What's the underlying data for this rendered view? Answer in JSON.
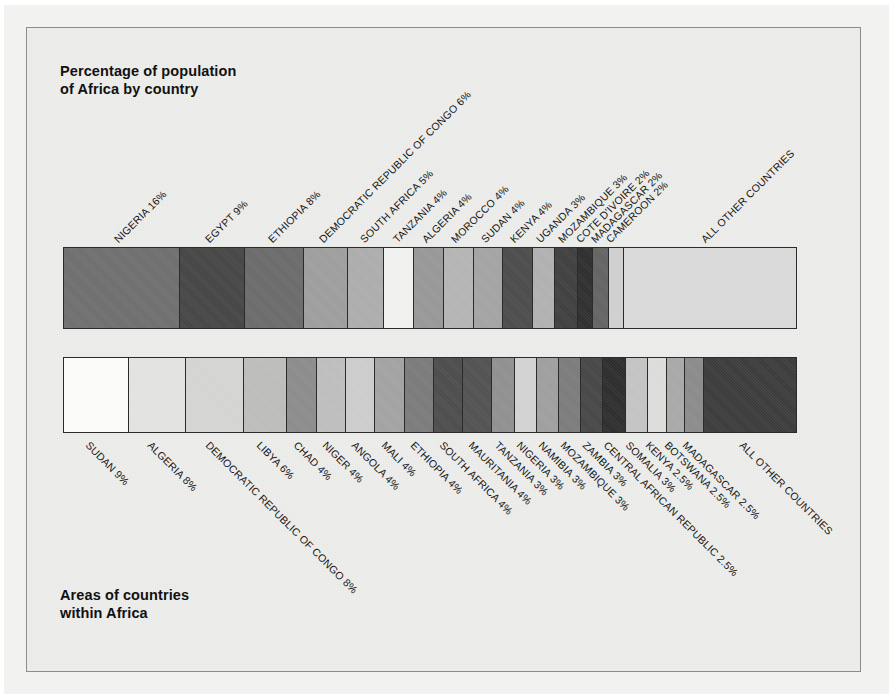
{
  "figure": {
    "top_title": "Percentage of population\nof Africa by country",
    "bottom_title": "Areas of countries\nwithin Africa",
    "frame_color": "#8e8e8e",
    "background_color": "#efefed",
    "outline_color": "#2b2b2b"
  },
  "chart_data": [
    {
      "type": "bar",
      "orientation": "horizontal-stacked",
      "title": "Percentage of population of Africa by country",
      "xlabel": "",
      "ylabel": "",
      "units": "percent",
      "total": 100,
      "grid": false,
      "legend": "none",
      "categories": [
        "NIGERIA",
        "EGYPT",
        "ETHIOPIA",
        "DEMOCRATIC REPUBLIC OF CONGO",
        "SOUTH AFRICA",
        "TANZANIA",
        "ALGERIA",
        "MOROCCO",
        "SUDAN",
        "KENYA",
        "UGANDA",
        "MOZAMBIQUE",
        "COTE D'IVOIRE",
        "MADAGASCAR",
        "CAMEROON",
        "ALL OTHER COUNTRIES"
      ],
      "values": [
        16,
        9,
        8,
        6,
        5,
        4,
        4,
        4,
        4,
        4,
        3,
        3,
        2,
        2,
        2,
        24
      ],
      "labels": [
        "NIGERIA 16%",
        "EGYPT 9%",
        "ETHIOPIA 8%",
        "DEMOCRATIC REPUBLIC OF CONGO 6%",
        "SOUTH AFRICA 5%",
        "TANZANIA 4%",
        "ALGERIA 4%",
        "MOROCCO 4%",
        "SUDAN 4%",
        "KENYA 4%",
        "UGANDA 3%",
        "MOZAMBIQUE 3%",
        "COTE D'IVOIRE 2%",
        "MADAGASCAR 2%",
        "CAMEROON 2%",
        "ALL OTHER COUNTRIES"
      ],
      "colors": [
        "#6e6e6e",
        "#454545",
        "#6a6a6a",
        "#9d9d9d",
        "#acacac",
        "#f0f0ee",
        "#979797",
        "#b4b4b4",
        "#a3a3a3",
        "#4b4b4b",
        "#b0b0b0",
        "#3f3f3f",
        "#2e2e2e",
        "#636363",
        "#cfcfcf",
        "#d9d9d9",
        "#d2d2d2"
      ]
    },
    {
      "type": "bar",
      "orientation": "horizontal-stacked",
      "title": "Areas of countries within Africa",
      "xlabel": "",
      "ylabel": "",
      "units": "percent",
      "total": 100,
      "grid": false,
      "legend": "none",
      "categories": [
        "SUDAN",
        "ALGERIA",
        "DEMOCRATIC REPUBLIC OF CONGO",
        "LIBYA",
        "CHAD",
        "NIGER",
        "ANGOLA",
        "MALI",
        "ETHIOPIA",
        "SOUTH AFRICA",
        "MAURITANIA",
        "TANZANIA",
        "NIGERIA",
        "NAMIBIA",
        "MOZAMBIQUE",
        "ZAMBIA",
        "CENTRAL AFRICAN REPUBLIC",
        "SOMALIA",
        "KENYA",
        "BOTSWANA",
        "MADAGASCAR",
        "ALL OTHER COUNTRIES"
      ],
      "values": [
        9,
        8,
        8,
        6,
        4,
        4,
        4,
        4,
        4,
        4,
        4,
        3,
        3,
        3,
        3,
        3,
        3,
        3,
        2.5,
        2.5,
        2.5,
        13
      ],
      "labels": [
        "SUDAN 9%",
        "ALGERIA 8%",
        "DEMOCRATIC REPUBLIC OF CONGO 8%",
        "LIBYA 6%",
        "CHAD 4%",
        "NIGER 4%",
        "ANGOLA 4%",
        "MALI 4%",
        "ETHIOPIA 4%",
        "SOUTH AFRICA 4%",
        "MAURITANIA 4%",
        "TANZANIA 3%",
        "NIGERIA 3%",
        "NAMIBIA 3%",
        "MOZAMBIQUE 3%",
        "ZAMBIA 3%",
        "CENTRAL AFRICAN REPUBLIC 2.5%",
        "SOMALIA 3%",
        "KENYA 2.5%",
        "BOTSWANA 2.5%",
        "MADAGASCAR 2.5%",
        "ALL OTHER COUNTRIES"
      ],
      "colors": [
        "#fbfbfa",
        "#e2e2e0",
        "#d4d4d2",
        "#bcbcba",
        "#8b8b8b",
        "#bdbdbd",
        "#cccccc",
        "#a2a2a2",
        "#7a7a7a",
        "#4c4c4c",
        "#515151",
        "#8f8f8f",
        "#d2d2d2",
        "#9e9e9e",
        "#7b7b7b",
        "#464646",
        "#2d2d2d",
        "#c3c3c3",
        "#dcdcda",
        "#a8a8a8",
        "#8a8a8a",
        "#3b3b3b",
        "#d6d6d4"
      ]
    }
  ]
}
